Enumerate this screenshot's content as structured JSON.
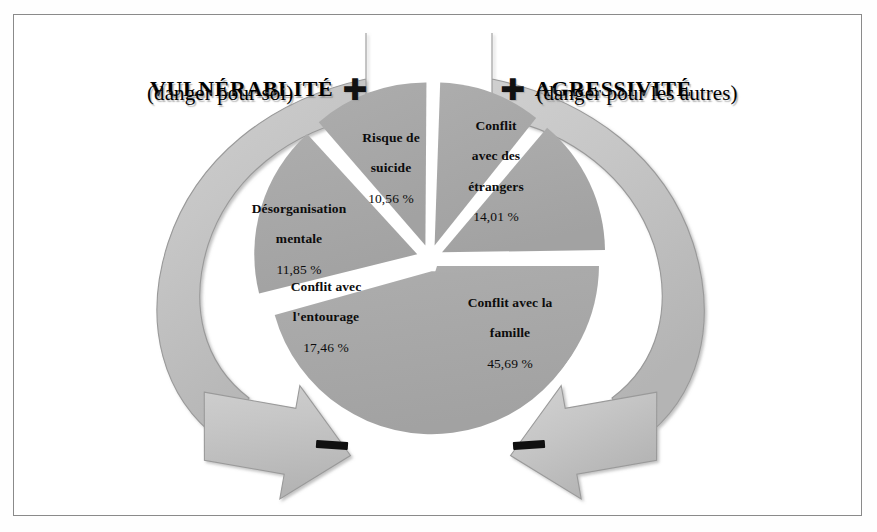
{
  "figure": {
    "title_left": "VULNÉRABLITÉ",
    "title_right": "AGRESSIVITÉ",
    "subtitle_left": "(danger pour soi)",
    "subtitle_right": "(danger pour les autres)",
    "plus_sign": "✚",
    "minus_sign": "▬",
    "colors": {
      "slice_fill": "#a8a8a8",
      "arrow_fill": "#c3c3c3",
      "arrow_stroke": "#9a9a9a",
      "frame_stroke": "#8a8a8a",
      "background": "#ffffff",
      "text": "#000000"
    }
  },
  "chart_data": {
    "type": "pie",
    "title": "",
    "unit": "%",
    "legend": "none",
    "exploded": true,
    "start_angle_deg": 0,
    "direction": "clockwise",
    "categories": [
      "Conflit avec la famille",
      "Conflit avec l'entourage",
      "Désorganisation mentale",
      "Risque de suicide",
      "Conflit avec des étrangers"
    ],
    "values": [
      45.69,
      17.46,
      11.85,
      10.56,
      14.01
    ],
    "labels": [
      "45,69 %",
      "17,46 %",
      "11,85 %",
      "10,56 %",
      "14,01 %"
    ],
    "slices": [
      {
        "name": "Conflit avec la famille",
        "line1": "Conflit avec la",
        "line2": "famille",
        "line3": null,
        "value": 45.69,
        "label": "45,69 %",
        "group": "agressivité"
      },
      {
        "name": "Conflit avec l'entourage",
        "line1": "Conflit avec",
        "line2": "l'entourage",
        "line3": null,
        "value": 17.46,
        "label": "17,46 %",
        "group": "vulnérabilité"
      },
      {
        "name": "Désorganisation mentale",
        "line1": "Désorganisation",
        "line2": "mentale",
        "line3": null,
        "value": 11.85,
        "label": "11,85 %",
        "group": "vulnérabilité"
      },
      {
        "name": "Risque de suicide",
        "line1": "Risque de",
        "line2": "suicide",
        "line3": null,
        "value": 10.56,
        "label": "10,56 %",
        "group": "vulnérabilité"
      },
      {
        "name": "Conflit avec des étrangers",
        "line1": "Conflit",
        "line2": "avec des",
        "line3": "étrangers",
        "value": 14.01,
        "label": "14,01 %",
        "group": "agressivité"
      }
    ]
  },
  "arrows": {
    "left": {
      "name": "vulnerability-arrow",
      "top_marker": "✚",
      "bottom_marker": "▬",
      "direction": "clockwise-down-right"
    },
    "right": {
      "name": "aggressiveness-arrow",
      "top_marker": "✚",
      "bottom_marker": "▬",
      "direction": "counterclockwise-down-left"
    }
  }
}
